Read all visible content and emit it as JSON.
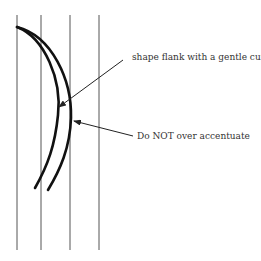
{
  "diagram": {
    "labels": {
      "top": "shape flank with a gentle curve",
      "bottom": "Do NOT over accentuate"
    },
    "colors": {
      "background": "#ffffff",
      "guide_lines": "#555555",
      "curves": "#111111",
      "leader_lines": "#222222",
      "text": "#333333"
    },
    "guide_lines_x": [
      17,
      41,
      70,
      99
    ]
  }
}
